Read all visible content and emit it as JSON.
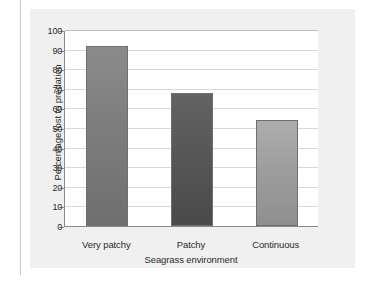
{
  "chart_data": {
    "type": "bar",
    "title": "",
    "subtitle": "",
    "xlabel": "Seagrass environment",
    "ylabel": "Percentage lost to predation",
    "categories": [
      "Very patchy",
      "Patchy",
      "Continuous"
    ],
    "values": [
      92,
      68,
      54
    ],
    "series": [
      {
        "name": "Percentage lost to predation",
        "values": [
          92,
          68,
          54
        ]
      }
    ],
    "ylim": [
      0,
      100
    ],
    "y_ticks": [
      0,
      10,
      20,
      30,
      40,
      50,
      60,
      70,
      80,
      90,
      100
    ],
    "y_tick_labels": [
      "0",
      "10",
      "20",
      "30",
      "40",
      "50",
      "60",
      "70",
      "80",
      "90",
      "100"
    ],
    "grid": true,
    "grid_axis": "y",
    "legend": false,
    "legend_position": "none",
    "annotations": [],
    "bar_colors": [
      "#7d7d7d",
      "#575757",
      "#9e9e9e"
    ],
    "bar_colors_top": [
      "#8b8b8b",
      "#636363",
      "#adadad"
    ],
    "bar_colors_bottom": [
      "#6f6f6f",
      "#4a4a4a",
      "#8f8f8f"
    ],
    "bar_edge_color": "#6f6f6f"
  },
  "figure": {
    "panel_color": "#f0f0f0",
    "plot_background": "#ffffff",
    "axis_color": "#8a8a8a",
    "gridline_color": "#d8d8d8",
    "text_color": "#2b2b2b"
  }
}
